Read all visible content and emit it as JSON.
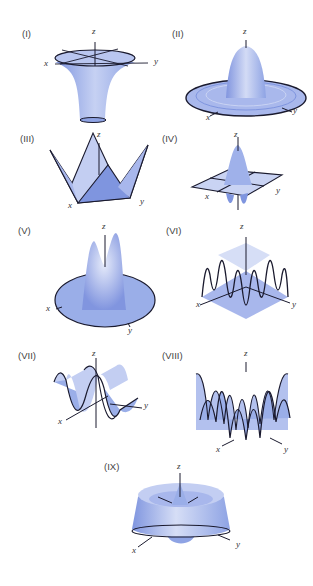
{
  "figure": {
    "panels": [
      {
        "id": "I",
        "label": "(I)",
        "axes": {
          "x": "x",
          "y": "y",
          "z": "z"
        },
        "shape": "trumpet / funnel surface"
      },
      {
        "id": "II",
        "label": "(II)",
        "axes": {
          "x": "x",
          "y": "y",
          "z": "z"
        },
        "shape": "central peak with concentric ripples"
      },
      {
        "id": "III",
        "label": "(III)",
        "axes": {
          "x": "x",
          "y": "y",
          "z": "z"
        },
        "shape": "four-pointed folded surface"
      },
      {
        "id": "IV",
        "label": "(IV)",
        "axes": {
          "x": "x",
          "y": "y",
          "z": "z"
        },
        "shape": "peak with dips on square domain"
      },
      {
        "id": "V",
        "label": "(V)",
        "axes": {
          "x": "x",
          "y": "y",
          "z": "z"
        },
        "shape": "two peaks on circular disc"
      },
      {
        "id": "VI",
        "label": "(VI)",
        "axes": {
          "x": "x",
          "y": "y",
          "z": "z"
        },
        "shape": "oscillating square-edged surface"
      },
      {
        "id": "VII",
        "label": "(VII)",
        "axes": {
          "x": "x",
          "y": "y",
          "z": "z"
        },
        "shape": "sinusoidal sheet"
      },
      {
        "id": "VIII",
        "label": "(VIII)",
        "axes": {
          "x": "x",
          "y": "y",
          "z": "z"
        },
        "shape": "egg-crate oscillating peaks"
      },
      {
        "id": "IX",
        "label": "(IX)",
        "axes": {
          "x": "x",
          "y": "y",
          "z": "z"
        },
        "shape": "bowl with central spike"
      }
    ],
    "colors": {
      "surface": "#9aaee8",
      "surface_light": "#d6def6",
      "surface_dark": "#6f86d6",
      "outline": "#1a1a2e",
      "background": "#ffffff"
    }
  }
}
